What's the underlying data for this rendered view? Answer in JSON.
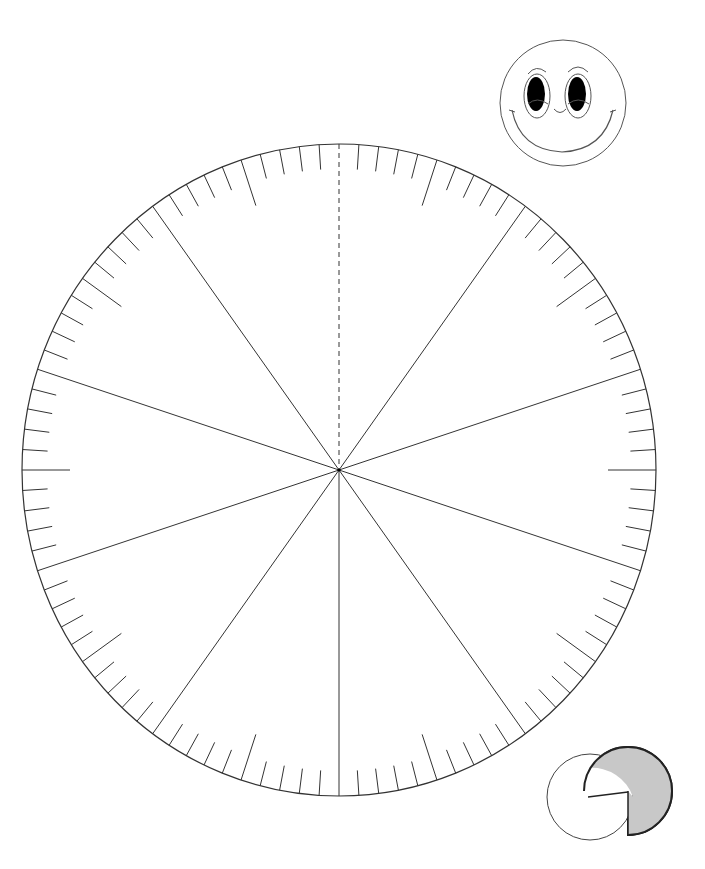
{
  "protractor": {
    "center": [
      339,
      470
    ],
    "rx": 317,
    "ry": 326,
    "tick_count": 100,
    "tick_step_deg": 3.6,
    "short_tick_len": 25,
    "long_tick_every": 5,
    "long_tick_len": 48,
    "radial_line_every_deg": 36,
    "dashed_reference_deg": 0,
    "stroke": "#333333"
  },
  "smiley": {
    "center": [
      563,
      103
    ],
    "r": 63,
    "eye_color": "#000000"
  },
  "pie_icon": {
    "white_circle": {
      "center": [
        590,
        797
      ],
      "r": 43
    },
    "gray_pie": {
      "center": [
        628,
        791
      ],
      "r": 44,
      "fill": "#c8c8c8",
      "missing_quadrant": "bottom-left"
    }
  }
}
